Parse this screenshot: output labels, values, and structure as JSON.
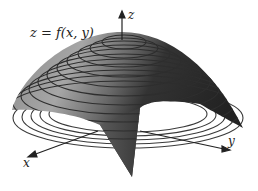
{
  "figure": {
    "equation_label": "z = f(x, y)",
    "axes": {
      "z_label": "z",
      "x_label": "x",
      "y_label": "y"
    },
    "surface": {
      "description": "downward-opening paraboloid-like surface with level curves drawn on it and projected as ellipses below",
      "contour_count": 11
    },
    "colors": {
      "surface_light": "#a8a8a8",
      "surface_dark": "#2a2a2a",
      "contour": "#3a3a3a",
      "axis": "#222222"
    }
  }
}
